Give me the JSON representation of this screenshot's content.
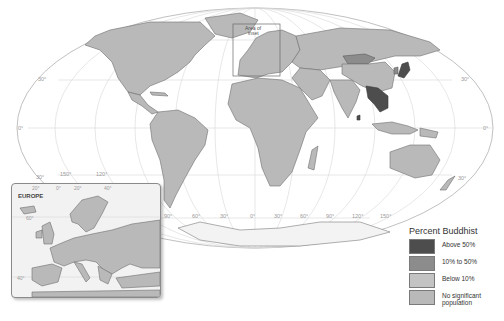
{
  "map": {
    "title": "Percent Buddhist",
    "projection": "world-oval",
    "area_of_inset_label": "Area of inset",
    "meridian_labels_bottom": [
      "90°",
      "60°",
      "30°",
      "0°",
      "30°",
      "60°",
      "90°",
      "120°",
      "150°"
    ],
    "meridian_labels_left": [
      "150°",
      "120°"
    ],
    "parallel_labels_left": [
      "30°",
      "0°",
      "30°"
    ],
    "parallel_labels_right": [
      "30°",
      "0°",
      "30°"
    ],
    "colors": {
      "above_50": "#4d4d4d",
      "10_to_50": "#8c8c8c",
      "below_10": "#c3c3c3",
      "no_significant": "#b9b9b9"
    },
    "highlighted_regions": {
      "above_50": [
        "Myanmar",
        "Thailand",
        "Laos",
        "Cambodia",
        "Bhutan",
        "Sri Lanka",
        "Japan",
        "Mongolia"
      ],
      "10_to_50": [
        "China",
        "South Korea",
        "Vietnam",
        "Singapore"
      ]
    }
  },
  "inset": {
    "title": "EUROPE",
    "lon_labels": [
      "20°",
      "0°",
      "20°",
      "40°"
    ],
    "lat_labels": [
      "60°",
      "40°"
    ]
  },
  "legend": {
    "title": "Percent Buddhist",
    "items": [
      {
        "label": "Above 50%",
        "color": "#4d4d4d"
      },
      {
        "label": "10% to 50%",
        "color": "#8c8c8c"
      },
      {
        "label": "Below 10%",
        "color": "#c3c3c3"
      },
      {
        "label": "No significant population",
        "color": "#b9b9b9"
      }
    ]
  }
}
